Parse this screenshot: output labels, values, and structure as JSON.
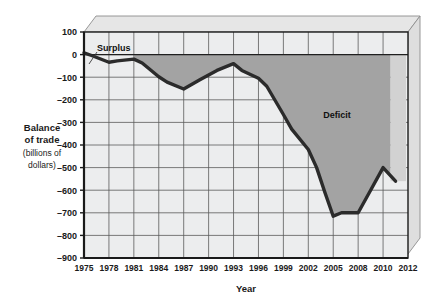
{
  "chart_data": {
    "type": "line",
    "title": "",
    "xlabel": "Year",
    "ylabel_bold_line1": "Balance",
    "ylabel_bold_line2": "of trade",
    "ylabel_reg_line1": "(billions of",
    "ylabel_reg_line2": "dollars)",
    "ylabel_full": "Balance of trade (billions of dollars)",
    "xlim": [
      1975,
      2012
    ],
    "ylim": [
      -900,
      100
    ],
    "ytick_step": 100,
    "grid": true,
    "legend": "none",
    "yticks": [
      100,
      0,
      -100,
      -200,
      -300,
      -400,
      -500,
      -600,
      -700,
      -800,
      -900
    ],
    "ytick_labels": [
      "100",
      "0",
      "-100",
      "-200",
      "-300",
      "-400",
      "-500",
      "-600",
      "-700",
      "-800",
      "-900"
    ],
    "xticks": [
      1975,
      1978,
      1981,
      1984,
      1987,
      1990,
      1993,
      1996,
      1999,
      2002,
      2005,
      2008,
      2010,
      2012
    ],
    "xtick_labels": [
      "1975",
      "1978",
      "1981",
      "1984",
      "1987",
      "1990",
      "1993",
      "1996",
      "1999",
      "2002",
      "2005",
      "2008",
      "2010",
      "2012"
    ],
    "series": [
      {
        "name": "Balance of trade",
        "x": [
          1975,
          1976,
          1978,
          1979,
          1981,
          1982,
          1984,
          1985,
          1987,
          1989,
          1991,
          1993,
          1994,
          1996,
          1997,
          1999,
          2000,
          2002,
          2003,
          2004,
          2005,
          2006,
          2008,
          2009,
          2010,
          2011
        ],
        "values": [
          8,
          -5,
          -34,
          -28,
          -20,
          -37,
          -98,
          -122,
          -152,
          -110,
          -70,
          -40,
          -70,
          -105,
          -140,
          -265,
          -330,
          -420,
          -500,
          -610,
          -715,
          -700,
          -700,
          -600,
          -500,
          -560
        ]
      }
    ],
    "annotations": [
      {
        "label": "Surplus",
        "x": 1976,
        "y": 90
      },
      {
        "label": "Deficit",
        "x": 2004,
        "y": -265
      }
    ],
    "shaded_region": {
      "label": "Deficit",
      "from_x": 1981,
      "to_x": 2010.6,
      "baseline": 0,
      "color": "#a3a3a3"
    },
    "colors": {
      "plot_background": "#eceded",
      "grid": "#5a5a5a",
      "line": "#2b2b2b",
      "deficit_fill": "#a3a3a3",
      "deficit_fill_edge": "#d2d2d2",
      "frame_3d_top": "#e4e4e4",
      "frame_3d_side": "#dcdcdc",
      "axis": "#1a1a1a"
    }
  }
}
